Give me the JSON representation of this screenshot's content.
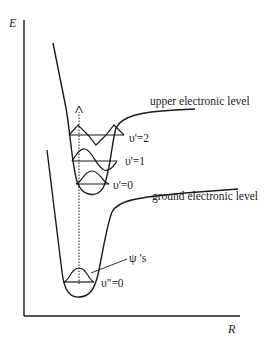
{
  "diagram": {
    "type": "potential-energy-curves",
    "axes": {
      "y_label": "E",
      "x_label": "R"
    },
    "curves": [
      {
        "id": "upper",
        "label": "upper electronic level"
      },
      {
        "id": "ground",
        "label": "ground electronic level"
      }
    ],
    "levels": {
      "upper": [
        {
          "label": "υ'=2"
        },
        {
          "label": "υ'=1"
        },
        {
          "label": "υ'=0"
        }
      ],
      "ground": [
        {
          "label": "υ\"=0"
        }
      ]
    },
    "annotation": {
      "label": "ψ 's"
    },
    "transition": {
      "style": "dotted-arrow",
      "direction": "up"
    },
    "colors": {
      "line": "#1a1a1a",
      "text": "#222222",
      "background": "#ffffff"
    }
  }
}
